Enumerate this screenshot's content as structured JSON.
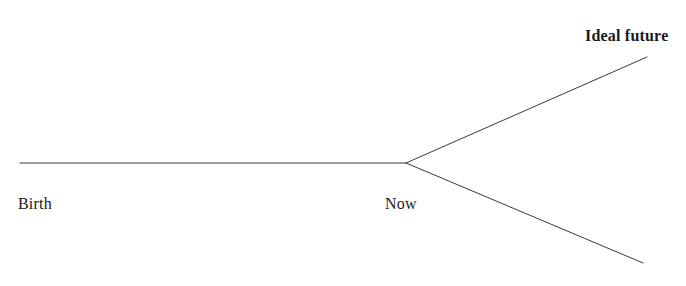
{
  "diagram": {
    "type": "branching-timeline",
    "background_color": "#ffffff",
    "stroke_color": "#3a3a3a",
    "stroke_width": 1,
    "canvas": {
      "width": 686,
      "height": 286
    },
    "labels": {
      "birth": "Birth",
      "now": "Now",
      "ideal_future": "Ideal future"
    },
    "nodes": [
      {
        "name": "birth",
        "x": 20,
        "y": 163
      },
      {
        "name": "now",
        "x": 406,
        "y": 163
      },
      {
        "name": "ideal-future",
        "x": 647,
        "y": 57
      },
      {
        "name": "alternate-future",
        "x": 643,
        "y": 263
      }
    ],
    "paths": {
      "past": "M20,163 L406,163",
      "upper_branch": "M406,163 L647,57",
      "lower_branch": "M406,163 L643,263"
    }
  }
}
